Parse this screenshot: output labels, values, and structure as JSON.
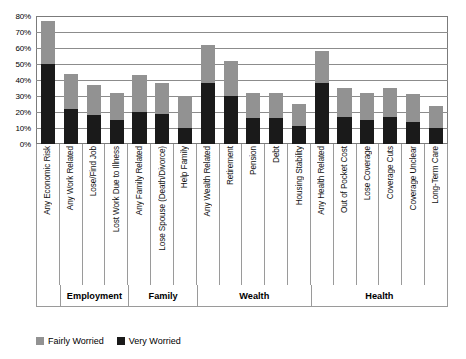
{
  "chart_data": {
    "type": "bar",
    "title": "",
    "subtitle": "",
    "xlabel": "",
    "ylabel": "",
    "stacked": true,
    "grid": true,
    "legend_position": "bottom-left",
    "ylim": [
      0,
      80
    ],
    "ytick_labels": [
      "80%",
      "70%",
      "60%",
      "50%",
      "40%",
      "30%",
      "20%",
      "10%",
      "0%"
    ],
    "ytick_values": [
      80,
      70,
      60,
      50,
      40,
      30,
      20,
      10,
      0
    ],
    "categories": [
      "Any Economic Risk",
      "Any Work Related",
      "Lose/Find Job",
      "Lost Work Due to Illness",
      "Any Family Related",
      "Lose Spouse (Death/Divorce)",
      "Help Family",
      "Any Wealth Related",
      "Retirement",
      "Pension",
      "Debt",
      "Housing Stability",
      "Any Health Related",
      "Out of Pocket Cost",
      "Lose Coverage",
      "Coverage Cuts",
      "Coverage Unclear",
      "Long-Term Care"
    ],
    "series": [
      {
        "name": "Very Worried",
        "color": "#1a1a1a",
        "values": [
          50,
          22,
          18,
          15,
          20,
          19,
          10,
          38,
          30,
          16,
          16,
          11,
          38,
          17,
          15,
          17,
          14,
          10
        ]
      },
      {
        "name": "Fairly Worried",
        "color": "#929292",
        "values": [
          27,
          22,
          19,
          17,
          23,
          19,
          20,
          24,
          22,
          16,
          16,
          14,
          20,
          18,
          17,
          18,
          17,
          14
        ]
      }
    ],
    "totals": [
      77,
      44,
      37,
      32,
      43,
      38,
      30,
      62,
      52,
      32,
      32,
      25,
      58,
      35,
      32,
      35,
      31,
      24
    ],
    "groups": [
      {
        "label": "",
        "span": 1
      },
      {
        "label": "Employment",
        "span": 3
      },
      {
        "label": "Family",
        "span": 3
      },
      {
        "label": "Wealth",
        "span": 5
      },
      {
        "label": "Health",
        "span": 6
      }
    ]
  },
  "legend": {
    "items": [
      {
        "label": "Fairly Worried",
        "color": "#929292"
      },
      {
        "label": "Very Worried",
        "color": "#1a1a1a"
      }
    ]
  }
}
